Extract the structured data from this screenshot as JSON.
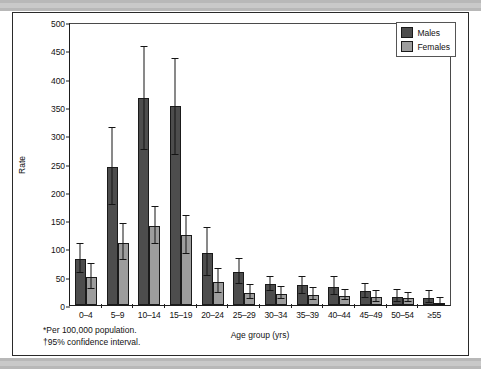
{
  "figure": {
    "y_axis_label": "Rate",
    "x_axis_label": "Age group (yrs)",
    "legend": [
      {
        "key": "males",
        "label": "Males",
        "color": "#4d4d4d"
      },
      {
        "key": "females",
        "label": "Females",
        "color": "#9d9d9d"
      }
    ],
    "footnotes": [
      "*Per 100,000 population.",
      "†95% confidence interval."
    ],
    "footnote_marks": [
      "*",
      "†"
    ],
    "footnote_texts": [
      "Per 100,000 population.",
      "95% confidence interval."
    ]
  },
  "chart_data": {
    "type": "bar",
    "title": "",
    "xlabel": "Age group (yrs)",
    "ylabel": "Rate",
    "ylim": [
      0,
      500
    ],
    "yticks": [
      0,
      50,
      100,
      150,
      200,
      250,
      300,
      350,
      400,
      450,
      500
    ],
    "grid": false,
    "legend_position": "top-right",
    "error_bars": "95% confidence interval",
    "categories": [
      "0–4",
      "5–9",
      "10–14",
      "15–19",
      "20–24",
      "25–29",
      "30–34",
      "35–39",
      "40–44",
      "45–49",
      "50–54",
      "≥55"
    ],
    "series": [
      {
        "name": "Males",
        "color": "#4d4d4d",
        "values": [
          81,
          244,
          366,
          352,
          92,
          59,
          37,
          35,
          32,
          24,
          14,
          12
        ],
        "ci_low": [
          57,
          176,
          273,
          265,
          51,
          37,
          24,
          20,
          17,
          12,
          6,
          4
        ],
        "ci_high": [
          107,
          312,
          456,
          435,
          136,
          82,
          50,
          50,
          49,
          38,
          27,
          24
        ]
      },
      {
        "name": "Females",
        "color": "#9d9d9d",
        "values": [
          50,
          109,
          140,
          123,
          40,
          22,
          20,
          18,
          16,
          14,
          12,
          4
        ],
        "ci_low": [
          29,
          79,
          107,
          91,
          21,
          11,
          10,
          8,
          8,
          6,
          5,
          0
        ],
        "ci_high": [
          73,
          143,
          174,
          157,
          64,
          35,
          32,
          30,
          27,
          25,
          22,
          12
        ]
      }
    ]
  }
}
